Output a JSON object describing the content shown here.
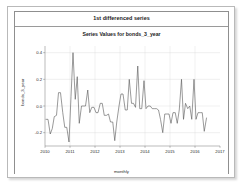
{
  "panel": {
    "title": "1st differenced series"
  },
  "chart_data": {
    "type": "line",
    "title": "Series Values for bonds_3_year",
    "xlabel": "monthly",
    "ylabel": "bonds_3_year",
    "grid": true,
    "legend": false,
    "xlim": [
      2010.0,
      2017.0
    ],
    "ylim": [
      -0.3,
      0.45
    ],
    "xticks": [
      2010,
      2011,
      2012,
      2013,
      2014,
      2015,
      2016,
      2017
    ],
    "xticklabels": [
      "2010",
      "2011",
      "2012",
      "2013",
      "2014",
      "2015",
      "2016",
      "2017"
    ],
    "yticks": [
      -0.2,
      0.0,
      0.2,
      0.4
    ],
    "yticklabels": [
      "-0.2",
      "0.0",
      "0.2",
      "0.4"
    ],
    "series": [
      {
        "name": "bonds_3_year",
        "color": "#555555",
        "x": [
          2010.04,
          2010.12,
          2010.21,
          2010.29,
          2010.37,
          2010.46,
          2010.54,
          2010.62,
          2010.71,
          2010.79,
          2010.87,
          2010.96,
          2011.04,
          2011.12,
          2011.21,
          2011.29,
          2011.37,
          2011.46,
          2011.54,
          2011.62,
          2011.71,
          2011.79,
          2011.87,
          2011.96,
          2012.04,
          2012.12,
          2012.21,
          2012.29,
          2012.37,
          2012.46,
          2012.54,
          2012.62,
          2012.71,
          2012.79,
          2012.87,
          2012.96,
          2013.04,
          2013.12,
          2013.21,
          2013.29,
          2013.37,
          2013.46,
          2013.54,
          2013.62,
          2013.71,
          2013.79,
          2013.87,
          2013.96,
          2014.04,
          2014.12,
          2014.21,
          2014.29,
          2014.37,
          2014.46,
          2014.54,
          2014.62,
          2014.71,
          2014.79,
          2014.87,
          2014.96,
          2015.04,
          2015.12,
          2015.21,
          2015.29,
          2015.37,
          2015.46,
          2015.54,
          2015.62,
          2015.71,
          2015.79,
          2015.87,
          2015.96,
          2016.04,
          2016.12,
          2016.21,
          2016.29,
          2016.37,
          2016.46
        ],
        "values": [
          -0.1,
          -0.1,
          -0.21,
          -0.17,
          -0.08,
          -0.07,
          0.1,
          0.1,
          -0.05,
          -0.16,
          -0.16,
          -0.27,
          0.07,
          0.4,
          0.05,
          0.22,
          -0.13,
          0.0,
          0.0,
          0.0,
          0.12,
          -0.05,
          -0.01,
          -0.01,
          -0.05,
          -0.05,
          0.02,
          0.02,
          -0.07,
          -0.07,
          -0.06,
          -0.12,
          -0.12,
          -0.26,
          -0.12,
          0.0,
          0.09,
          0.09,
          -0.03,
          -0.03,
          0.2,
          0.02,
          0.02,
          -0.01,
          0.3,
          -0.02,
          -0.02,
          0.19,
          -0.02,
          0.0,
          0.0,
          -0.02,
          -0.02,
          -0.02,
          -0.03,
          -0.1,
          -0.2,
          -0.06,
          -0.06,
          -0.06,
          -0.13,
          -0.05,
          -0.05,
          -0.13,
          -0.03,
          0.2,
          -0.1,
          0.02,
          -0.02,
          0.0,
          -0.1,
          0.2,
          -0.1,
          -0.05,
          -0.05,
          -0.05,
          -0.19,
          -0.09
        ]
      }
    ]
  }
}
